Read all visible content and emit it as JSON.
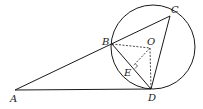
{
  "diagram": {
    "circle": {
      "center": "O",
      "cx": 153,
      "cy": 47,
      "r": 42
    },
    "points": {
      "A": {
        "label": "A",
        "x": 15,
        "y": 90
      },
      "B": {
        "label": "B",
        "x": 112,
        "y": 44
      },
      "C": {
        "label": "C",
        "x": 170,
        "y": 16
      },
      "D": {
        "label": "D",
        "x": 151,
        "y": 89
      },
      "O": {
        "label": "O",
        "x": 150,
        "y": 48
      },
      "E": {
        "label": "E",
        "x": 133,
        "y": 66
      }
    },
    "solid_segments": [
      "AC",
      "AD",
      "BD",
      "CD"
    ],
    "dashed_segments": [
      "OB",
      "OD",
      "OE"
    ],
    "marks": [
      "right-angle at E (OE ⊥ BD)"
    ]
  }
}
